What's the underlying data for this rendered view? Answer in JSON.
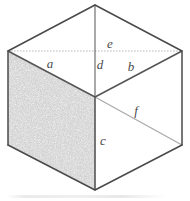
{
  "figure": {
    "canvas": {
      "width": 190,
      "height": 201
    },
    "colors": {
      "background": "#ffffff",
      "outline": "#4a4a4a",
      "inner_edge": "#6b6b6b",
      "faint_edge": "#b6b6b6",
      "label_text": "#4a4a4a",
      "left_face_fill": "#dcdcdc",
      "top_face_fill": "#ffffff",
      "right_face_fill": "#ffffff"
    },
    "vertices": {
      "top_apex": {
        "x": 95,
        "y": 5
      },
      "left": {
        "x": 8,
        "y": 51
      },
      "right": {
        "x": 182,
        "y": 51
      },
      "center": {
        "x": 95,
        "y": 97
      },
      "bottom_left": {
        "x": 8,
        "y": 145
      },
      "bottom_right": {
        "x": 182,
        "y": 145
      },
      "bottom_apex": {
        "x": 95,
        "y": 190
      }
    },
    "faces": [
      {
        "name": "top-face",
        "shading": "none",
        "points": "95,5 8,51 95,97 182,51"
      },
      {
        "name": "left-face",
        "shading": "stippled",
        "points": "8,51 8,145 95,190 95,97"
      },
      {
        "name": "right-face",
        "shading": "none",
        "points": "95,97 95,190 182,145 182,51"
      }
    ],
    "labels": [
      {
        "id": "a",
        "text": "a",
        "x": 50,
        "y": 63,
        "edge": "top-face-left-edge"
      },
      {
        "id": "b",
        "text": "b",
        "x": 131,
        "y": 66,
        "edge": "top-face-right-edge"
      },
      {
        "id": "c",
        "text": "c",
        "x": 103,
        "y": 140,
        "edge": "front-vertical-edge"
      },
      {
        "id": "d",
        "text": "d",
        "x": 100,
        "y": 64,
        "edge": "top-face-vertical-edge"
      },
      {
        "id": "e",
        "text": "e",
        "x": 110,
        "y": 43,
        "edge": "upper-horizontal-edge"
      },
      {
        "id": "f",
        "text": "f",
        "x": 136,
        "y": 110,
        "edge": "right-face-diagonal-edge"
      }
    ]
  }
}
